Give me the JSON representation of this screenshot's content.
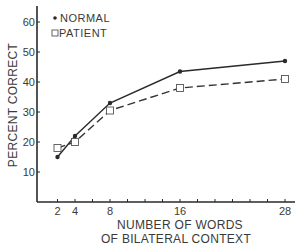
{
  "chart_data": {
    "type": "line",
    "title": "",
    "xlabel": "NUMBER OF WORDS OF BILATERAL CONTEXT",
    "xlabel_lines": [
      "NUMBER OF WORDS",
      "OF BILATERAL CONTEXT"
    ],
    "ylabel": "PERCENT CORRECT",
    "x": [
      2,
      4,
      8,
      16,
      28
    ],
    "x_tick_labels": [
      "2",
      "4",
      "8",
      "16",
      "28"
    ],
    "x_minor_ticks_every": 2,
    "xlim": [
      0,
      29
    ],
    "y_ticks": [
      10,
      20,
      30,
      40,
      50,
      60
    ],
    "ylim": [
      0,
      65
    ],
    "grid": false,
    "legend_position": "top-left",
    "series": [
      {
        "name": "NORMAL",
        "marker": "filled-circle",
        "line": "solid",
        "values": [
          15,
          22,
          33,
          43.5,
          47
        ]
      },
      {
        "name": "PATIENT",
        "marker": "open-square",
        "line": "dashed",
        "values": [
          18,
          20,
          30.5,
          38,
          41
        ]
      }
    ]
  },
  "colors": {
    "ink": "#2a2a2a",
    "background": "#ffffff"
  }
}
